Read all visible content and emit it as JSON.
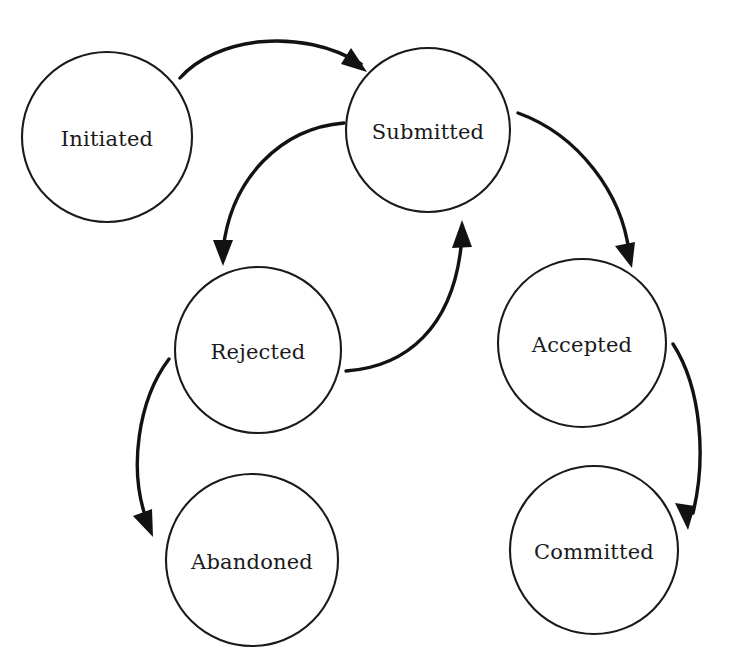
{
  "diagram": {
    "type": "state-diagram",
    "background_color": "#ffffff",
    "stroke_color": "#1a1a1a",
    "arrow_color": "#121212",
    "nodes": [
      {
        "id": "initiated",
        "label": "Initiated",
        "cx": 107,
        "cy": 137,
        "r": 85
      },
      {
        "id": "submitted",
        "label": "Submitted",
        "cx": 428,
        "cy": 130,
        "r": 82
      },
      {
        "id": "rejected",
        "label": "Rejected",
        "cx": 258,
        "cy": 350,
        "r": 83
      },
      {
        "id": "accepted",
        "label": "Accepted",
        "cx": 582,
        "cy": 343,
        "r": 84
      },
      {
        "id": "abandoned",
        "label": "Abandoned",
        "cx": 252,
        "cy": 560,
        "r": 86
      },
      {
        "id": "committed",
        "label": "Committed",
        "cx": 594,
        "cy": 550,
        "r": 84
      }
    ],
    "edges": [
      {
        "id": "initiated-to-submitted",
        "from": "Initiated",
        "to": "Submitted"
      },
      {
        "id": "submitted-to-rejected",
        "from": "Submitted",
        "to": "Rejected"
      },
      {
        "id": "rejected-to-submitted",
        "from": "Rejected",
        "to": "Submitted"
      },
      {
        "id": "submitted-to-accepted",
        "from": "Submitted",
        "to": "Accepted"
      },
      {
        "id": "rejected-to-abandoned",
        "from": "Rejected",
        "to": "Abandoned"
      },
      {
        "id": "accepted-to-committed",
        "from": "Accepted",
        "to": "Committed"
      }
    ]
  }
}
